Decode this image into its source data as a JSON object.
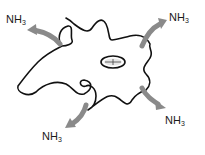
{
  "diagram": {
    "colors": {
      "chain": "#111111",
      "arrow": "#8a8a8a",
      "text": "#1a1a1a",
      "background": "#ffffff"
    },
    "labels": [
      {
        "id": "top-left",
        "base": "NH",
        "sub": "3"
      },
      {
        "id": "top-right",
        "base": "NH",
        "sub": "3"
      },
      {
        "id": "bottom-left",
        "base": "NH",
        "sub": "3"
      },
      {
        "id": "bottom-right",
        "base": "NH",
        "sub": "3"
      }
    ]
  }
}
